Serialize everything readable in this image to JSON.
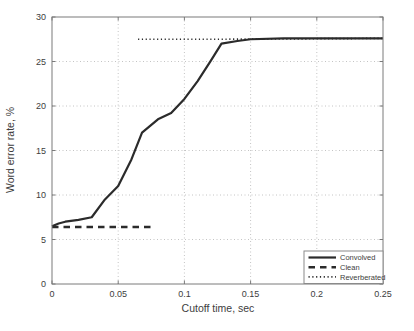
{
  "figure": {
    "background": "#ffffff"
  },
  "chart_data": {
    "type": "line",
    "title": "",
    "xlabel": "Cutoff time, sec",
    "ylabel": "Word error rate, %",
    "xlim": [
      0,
      0.25
    ],
    "ylim": [
      0,
      30
    ],
    "xticks": [
      0,
      0.05,
      0.1,
      0.15,
      0.2,
      0.25
    ],
    "xtick_labels": [
      "0",
      "0.05",
      "0.1",
      "0.15",
      "0.2",
      "0.25"
    ],
    "yticks": [
      0,
      5,
      10,
      15,
      20,
      25,
      30
    ],
    "ytick_labels": [
      "0",
      "5",
      "10",
      "15",
      "20",
      "25",
      "30"
    ],
    "grid": true,
    "legend_position": "lower right",
    "colors": {
      "line": "#2b2b2b",
      "grid": "#c4c4c4",
      "axis_box": "#7a7a7a",
      "text": "#3d3d3d",
      "legend_border": "#8a8a8a",
      "legend_background": "#ffffff"
    },
    "series": [
      {
        "name": "Convolved",
        "style": "solid",
        "points": [
          [
            0,
            6.5
          ],
          [
            0.005,
            6.8
          ],
          [
            0.01,
            7.0
          ],
          [
            0.02,
            7.2
          ],
          [
            0.03,
            7.5
          ],
          [
            0.04,
            9.5
          ],
          [
            0.05,
            11.0
          ],
          [
            0.06,
            14.0
          ],
          [
            0.068,
            17.0
          ],
          [
            0.08,
            18.5
          ],
          [
            0.09,
            19.2
          ],
          [
            0.1,
            20.8
          ],
          [
            0.11,
            22.8
          ],
          [
            0.12,
            25.1
          ],
          [
            0.128,
            27.0
          ],
          [
            0.14,
            27.3
          ],
          [
            0.15,
            27.5
          ],
          [
            0.175,
            27.6
          ],
          [
            0.2,
            27.6
          ],
          [
            0.225,
            27.6
          ],
          [
            0.25,
            27.6
          ]
        ]
      },
      {
        "name": "Clean",
        "style": "dashed",
        "points": [
          [
            0,
            6.4
          ],
          [
            0.077,
            6.4
          ]
        ]
      },
      {
        "name": "Reverberated",
        "style": "dotted",
        "points": [
          [
            0.065,
            27.5
          ],
          [
            0.13,
            27.5
          ],
          [
            0.25,
            27.6
          ]
        ]
      }
    ]
  }
}
